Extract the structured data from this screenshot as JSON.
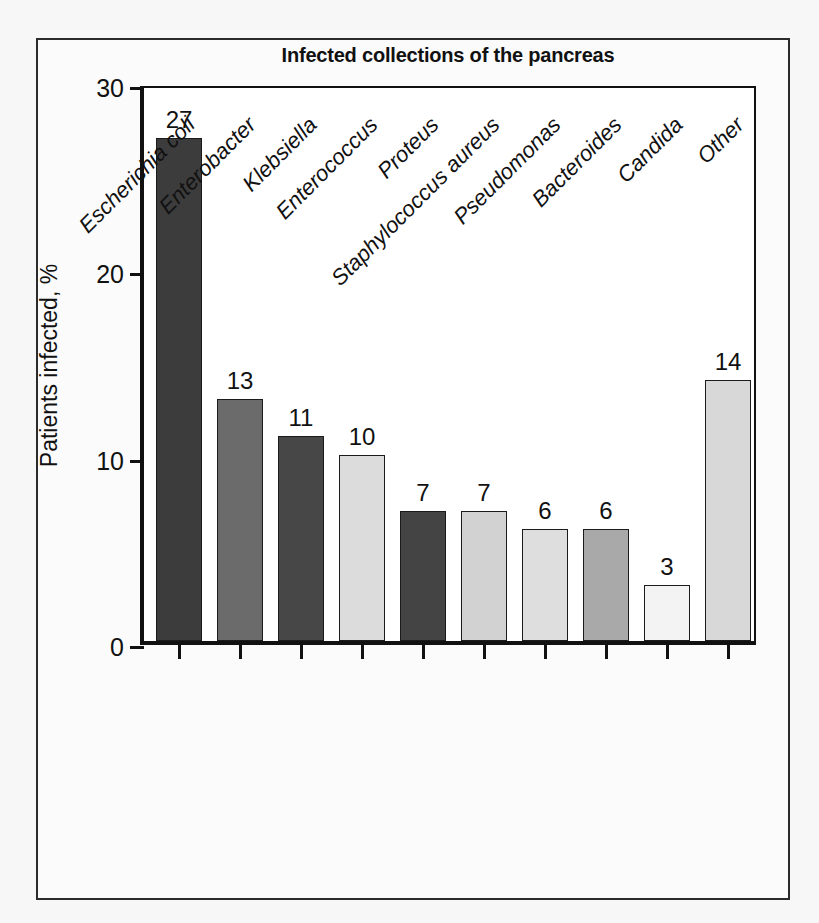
{
  "figure": {
    "title": "Infected collections of the pancreas",
    "background_color": "#ffffff",
    "frame_color": "#2b2b2b"
  },
  "chart_data": {
    "type": "bar",
    "title": "Infected collections of the pancreas",
    "xlabel": "",
    "ylabel": "Patients infected, %",
    "ylim": [
      0,
      30
    ],
    "yticks": [
      0,
      10,
      20,
      30
    ],
    "ytick_labels": [
      "0",
      "10",
      "20",
      "30"
    ],
    "grid": false,
    "legend": false,
    "value_labels": true,
    "xtick_label_rotation": -45,
    "xtick_label_style": "italic",
    "categories": [
      "Escherichia coli",
      "Enterobacter",
      "Klebsiella",
      "Enterococcus",
      "Proteus",
      "Staphylococcus aureus",
      "Pseudomonas",
      "Bacteroides",
      "Candida",
      "Other"
    ],
    "values": [
      27,
      13,
      11,
      10,
      7,
      7,
      6,
      6,
      3,
      14
    ],
    "bar_colors": [
      "#3c3c3c",
      "#6b6b6b",
      "#474747",
      "#dcdcdc",
      "#444444",
      "#d2d2d2",
      "#dedede",
      "#a9a9a9",
      "#f3f3f3",
      "#d8d8d8"
    ],
    "bar_edge_color": "#1b1b1b"
  }
}
